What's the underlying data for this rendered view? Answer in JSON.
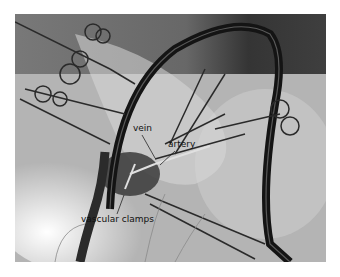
{
  "figure": {
    "type": "grayscale surgical photograph",
    "labels": {
      "vein": "vein",
      "artery": "artery",
      "clamps": "vascular clamps"
    }
  }
}
